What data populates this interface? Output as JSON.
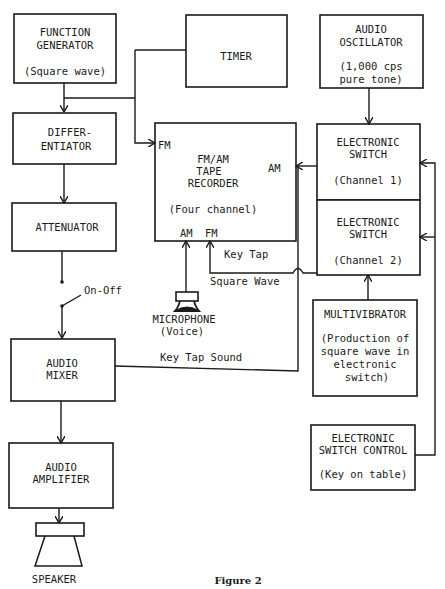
{
  "figure": {
    "caption": "Figure 2"
  },
  "blocks": {
    "function_generator": {
      "line1": "FUNCTION",
      "line2": "GENERATOR",
      "note": "(Square wave)"
    },
    "timer": {
      "line1": "TIMER"
    },
    "audio_oscillator": {
      "line1": "AUDIO",
      "line2": "OSCILLATOR",
      "note1": "(1,000 cps",
      "note2": "pure tone)"
    },
    "differentiator": {
      "line1": "DIFFER-",
      "line2": "ENTIATOR"
    },
    "tape_recorder": {
      "line1": "FM/AM",
      "line2": "TAPE",
      "line3": "RECORDER",
      "note": "(Four channel)",
      "in_fm_left": "FM",
      "in_am_right": "AM",
      "in_am_bottom": "AM",
      "in_fm_bottom": "FM"
    },
    "electronic_switch_1": {
      "line1": "ELECTRONIC",
      "line2": "SWITCH",
      "note": "(Channel 1)"
    },
    "electronic_switch_2": {
      "line1": "ELECTRONIC",
      "line2": "SWITCH",
      "note": "(Channel 2)"
    },
    "attenuator": {
      "line1": "ATTENUATOR"
    },
    "multivibrator": {
      "line1": "MULTIVIBRATOR",
      "note1": "(Production of",
      "note2": "square wave in",
      "note3": "electronic",
      "note4": "switch)"
    },
    "audio_mixer": {
      "line1": "AUDIO",
      "line2": "MIXER"
    },
    "switch_control": {
      "line1": "ELECTRONIC",
      "line2": "SWITCH CONTROL",
      "note": "(Key on table)"
    },
    "audio_amplifier": {
      "line1": "AUDIO",
      "line2": "AMPLIFIER"
    },
    "microphone": {
      "line1": "MICROPHONE",
      "line2": "(Voice)"
    },
    "speaker": {
      "label": "SPEAKER"
    }
  },
  "connections": {
    "on_off": "On-Off",
    "key_tap": "Key Tap",
    "square_wave": "Square Wave",
    "key_tap_sound": "Key Tap Sound"
  }
}
